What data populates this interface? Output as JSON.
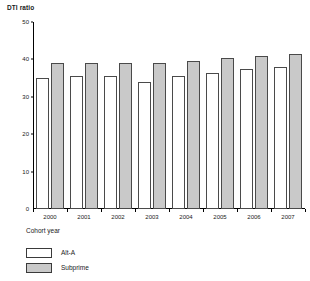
{
  "chart_data": {
    "type": "bar",
    "title": "",
    "ylabel": "DTI ratio",
    "xlabel": "Cohort year",
    "categories": [
      "2000",
      "2001",
      "2002",
      "2003",
      "2004",
      "2005",
      "2006",
      "2007"
    ],
    "series": [
      {
        "name": "Alt-A",
        "values": [
          35,
          35.5,
          35.5,
          34,
          35.5,
          36.5,
          37.5,
          38
        ]
      },
      {
        "name": "Subprime",
        "values": [
          39,
          39,
          39,
          39,
          39.5,
          40.5,
          41,
          41.5
        ]
      }
    ],
    "ylim": [
      0,
      50
    ],
    "yticks": [
      "0",
      "10",
      "20",
      "30",
      "40",
      "50"
    ],
    "ytick_values": [
      0,
      10,
      20,
      30,
      40,
      50
    ],
    "grid": false,
    "legend_position": "bottom-left",
    "colors": {
      "alt_a": "#ffffff",
      "subprime": "#c9c9c9",
      "outline": "#4a4a4a",
      "axis": "#000000",
      "text": "#1a1a1a"
    }
  },
  "legend": {
    "entries": [
      {
        "label": "Alt-A",
        "swatch": "alt-a-swatch"
      },
      {
        "label": "Subprime",
        "swatch": "subprime-swatch"
      }
    ]
  }
}
